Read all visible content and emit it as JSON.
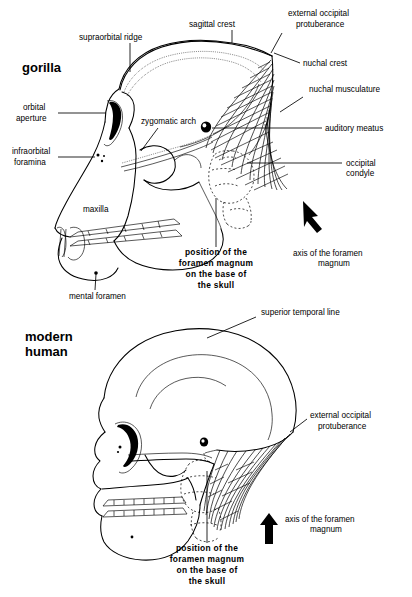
{
  "figure": {
    "background": "#ffffff",
    "ink": "#000000"
  },
  "panels": [
    {
      "id": "gorilla",
      "title": "gorilla",
      "labels": [
        {
          "name": "supraorbital-ridge",
          "text": "supraorbital ridge"
        },
        {
          "name": "sagittal-crest",
          "text": "sagittal crest"
        },
        {
          "name": "external-occipital-protuberance",
          "text": "external occipital",
          "text2": "protuberance"
        },
        {
          "name": "nuchal-crest",
          "text": "nuchal crest"
        },
        {
          "name": "nuchal-musculature",
          "text": "nuchal musculature"
        },
        {
          "name": "auditory-meatus",
          "text": "auditory meatus"
        },
        {
          "name": "occipital-condyle",
          "text": "occipital",
          "text2": "condyle"
        },
        {
          "name": "orbital-aperture",
          "text": "orbital",
          "text2": "aperture"
        },
        {
          "name": "infraorbital-foramina",
          "text": "infraorbital",
          "text2": "foramina"
        },
        {
          "name": "zygomatic-arch",
          "text": "zygomatic arch"
        },
        {
          "name": "maxilla",
          "text": "maxilla"
        },
        {
          "name": "mental-foramen",
          "text": "mental foramen"
        },
        {
          "name": "axis-of-foramen-magnum",
          "text": "axis of the foramen",
          "text2": "magnum"
        }
      ],
      "foramen_magnum_caption": {
        "name": "position-of-foramen-magnum",
        "line1": "position of the",
        "line2": "foramen magnum",
        "line3": "on the base of",
        "line4": "the skull"
      },
      "axis_arrow_direction": "diagonal-up-right"
    },
    {
      "id": "modern-human",
      "title_line1": "modern",
      "title_line2": "human",
      "labels": [
        {
          "name": "superior-temporal-line",
          "text": "superior temporal line"
        },
        {
          "name": "external-occipital-protuberance",
          "text": "external occipital",
          "text2": "protuberance"
        },
        {
          "name": "axis-of-foramen-magnum",
          "text": "axis of the foramen",
          "text2": "magnum"
        }
      ],
      "foramen_magnum_caption": {
        "name": "position-of-foramen-magnum",
        "line1": "position of the",
        "line2": "foramen magnum",
        "line3": "on the base of",
        "line4": "the skull"
      },
      "axis_arrow_direction": "vertical-up"
    }
  ]
}
